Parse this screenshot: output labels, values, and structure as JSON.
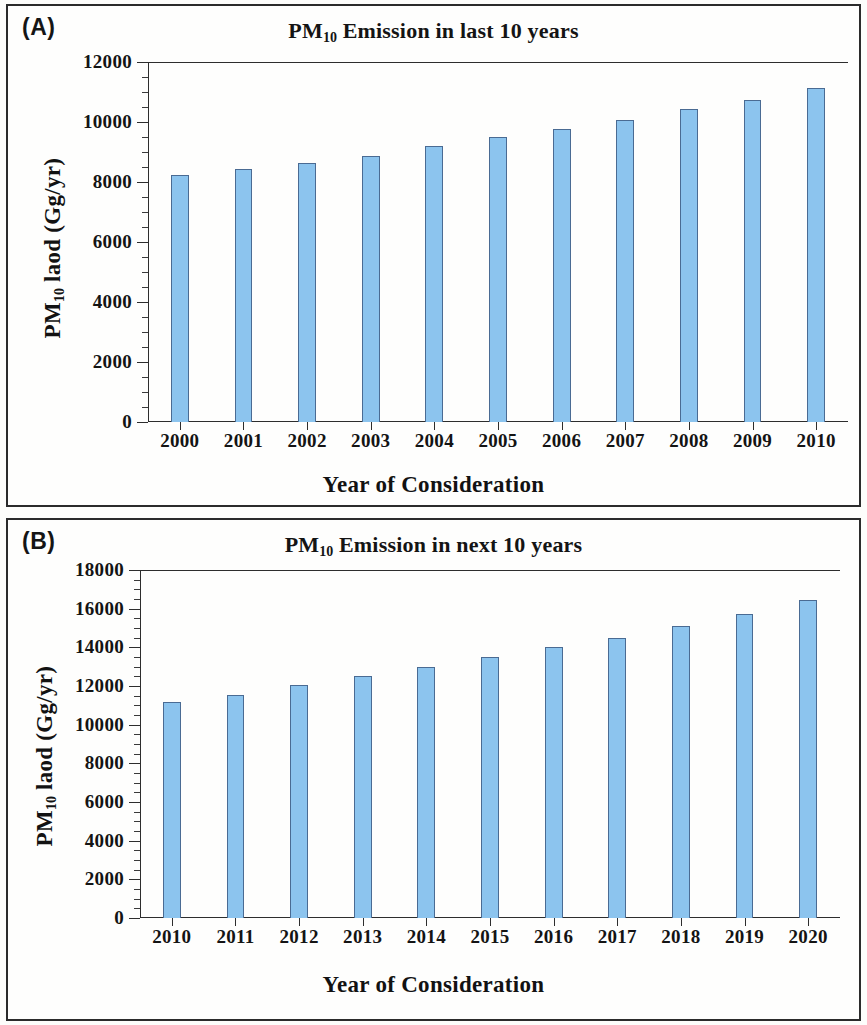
{
  "figure": {
    "panels": [
      {
        "panel_label": "(A)",
        "title_prefix": "PM",
        "title_sub": "10",
        "title_suffix": " Emission in last 10 years",
        "xlabel": "Year of Consideration",
        "ylabel_prefix": "PM",
        "ylabel_sub": "10",
        "ylabel_suffix": " laod (Gg/yr)"
      },
      {
        "panel_label": "(B)",
        "title_prefix": "PM",
        "title_sub": "10",
        "title_suffix": " Emission in next 10 years",
        "xlabel": "Year of Consideration",
        "ylabel_prefix": "PM",
        "ylabel_sub": "10",
        "ylabel_suffix": " laod (Gg/yr)"
      }
    ],
    "bar_fill_color": "#8cc4ee",
    "bar_edge_color": "#4a6b93",
    "frame_color": "#2d2d2d"
  },
  "chart_data": [
    {
      "type": "bar",
      "panel": "(A)",
      "title": "PM10 Emission in last 10 years",
      "xlabel": "Year of Consideration",
      "ylabel": "PM10 laod (Gg/yr)",
      "categories": [
        "2000",
        "2001",
        "2002",
        "2003",
        "2004",
        "2005",
        "2006",
        "2007",
        "2008",
        "2009",
        "2010"
      ],
      "values": [
        8250,
        8430,
        8620,
        8880,
        9190,
        9500,
        9770,
        10060,
        10430,
        10730,
        11120
      ],
      "ylim": [
        0,
        12000
      ],
      "ytick_labels": [
        "0",
        "2000",
        "4000",
        "6000",
        "8000",
        "10000",
        "12000"
      ],
      "ytick_values": [
        0,
        2000,
        4000,
        6000,
        8000,
        10000,
        12000
      ],
      "minor_tick_interval": 500,
      "grid": false,
      "legend": null
    },
    {
      "type": "bar",
      "panel": "(B)",
      "title": "PM10 Emission in next 10 years",
      "xlabel": "Year of Consideration",
      "ylabel": "PM10 laod (Gg/yr)",
      "categories": [
        "2010",
        "2011",
        "2012",
        "2013",
        "2014",
        "2015",
        "2016",
        "2017",
        "2018",
        "2019",
        "2020"
      ],
      "values": [
        11150,
        11550,
        12050,
        12500,
        12970,
        13480,
        14000,
        14500,
        15100,
        15720,
        16430
      ],
      "ylim": [
        0,
        18000
      ],
      "ytick_labels": [
        "0",
        "2000",
        "4000",
        "6000",
        "8000",
        "10000",
        "12000",
        "14000",
        "16000",
        "18000"
      ],
      "ytick_values": [
        0,
        2000,
        4000,
        6000,
        8000,
        10000,
        12000,
        14000,
        16000,
        18000
      ],
      "minor_tick_interval": 500,
      "grid": false,
      "legend": null
    }
  ]
}
